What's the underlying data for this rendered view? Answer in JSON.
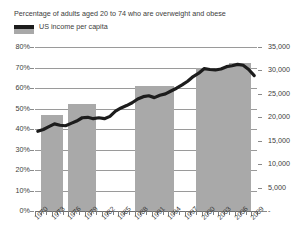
{
  "legend": {
    "items": [
      {
        "label": "Percentage of adults aged 20 to 74 who are overweight and obese",
        "marker": "bar-swatch",
        "color": "#a8a8a8"
      },
      {
        "label": "US income per capita",
        "marker": "line-swatch",
        "color": "#1c1c1c"
      }
    ]
  },
  "axes": {
    "left_ticks": [
      "80%",
      "70%",
      "60%",
      "50%",
      "40%",
      "30%",
      "20%",
      "10%",
      "0%"
    ],
    "right_ticks": [
      "35,000",
      "30,000",
      "25,000",
      "20,000",
      "15,000",
      "10,000",
      "5,000",
      "-"
    ],
    "x_labels": [
      "1970",
      "1973",
      "1976",
      "1979",
      "1982",
      "1985",
      "1988",
      "1991",
      "1994",
      "1997",
      "2000",
      "2003",
      "2006",
      "2009"
    ]
  },
  "chart_data": {
    "type": "bar",
    "title": "",
    "subtitle": "",
    "xlabel": "",
    "ylabel": "",
    "y_left_label": "Percentage of adults aged 20 to 74 who are overweight and obese",
    "y_right_label": "US income per capita",
    "ylim": [
      0,
      80
    ],
    "y2lim": [
      0,
      35000
    ],
    "xlim": [
      1970,
      2009
    ],
    "grid": true,
    "legend_position": "top-left",
    "x_tick_step_years": 1,
    "x_label_step_years": 3,
    "series": [
      {
        "name": "Percentage of adults aged 20 to 74 who are overweight and obese",
        "type": "bar",
        "axis": "left",
        "color": "#a9a9a9",
        "unit": "%",
        "bars": [
          {
            "label": "1971-1974",
            "start_year": 1971,
            "end_year": 1974,
            "value": 47
          },
          {
            "label": "1976-1980",
            "start_year": 1976,
            "end_year": 1980,
            "value": 52
          },
          {
            "label": "1988-1994",
            "start_year": 1988,
            "end_year": 1994,
            "value": 61
          },
          {
            "label": "1999-2004",
            "start_year": 1999,
            "end_year": 2004,
            "value": 70
          },
          {
            "label": "2005-2008",
            "start_year": 2005,
            "end_year": 2008,
            "value": 72
          }
        ]
      },
      {
        "name": "US income per capita",
        "type": "line",
        "axis": "right",
        "color": "#1c1c1c",
        "unit": "USD",
        "x": [
          1970,
          1971,
          1972,
          1973,
          1974,
          1975,
          1976,
          1977,
          1978,
          1979,
          1980,
          1981,
          1982,
          1983,
          1984,
          1985,
          1986,
          1987,
          1988,
          1989,
          1990,
          1991,
          1992,
          1993,
          1994,
          1995,
          1996,
          1997,
          1998,
          1999,
          2000,
          2001,
          2002,
          2003,
          2004,
          2005,
          2006,
          2007,
          2008,
          2009
        ],
        "values": [
          17000,
          17400,
          18000,
          18600,
          18300,
          18200,
          18700,
          19200,
          19900,
          20000,
          19700,
          19900,
          19700,
          20200,
          21300,
          22000,
          22500,
          23100,
          23900,
          24400,
          24600,
          24200,
          24700,
          25000,
          25600,
          26200,
          26900,
          27700,
          28700,
          29400,
          30400,
          30200,
          30100,
          30300,
          30800,
          31000,
          31300,
          31100,
          30200,
          28900
        ]
      }
    ]
  }
}
